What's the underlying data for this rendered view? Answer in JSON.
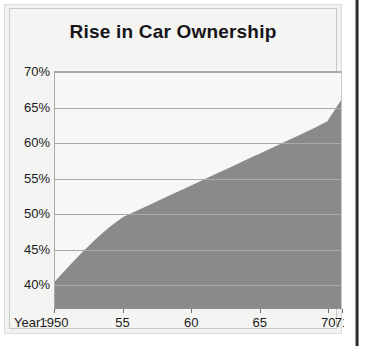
{
  "figure": {
    "title": "Rise in Car Ownership",
    "x_axis_title": "Year :"
  },
  "chart_data": {
    "type": "area",
    "title": "Rise in Car Ownership",
    "xlabel": "Year",
    "ylabel": "",
    "xlim": [
      1950,
      1971
    ],
    "ylim": [
      36.5,
      70
    ],
    "grid": true,
    "legend": null,
    "fill_color": "#8a8a8a",
    "gridline_color": "#a9a9a6",
    "plot_background": "#f7f7f5",
    "y_tick_labels": [
      "70%",
      "65%",
      "60%",
      "55%",
      "50%",
      "45%",
      "40%"
    ],
    "y_tick_values": [
      70,
      65,
      60,
      55,
      50,
      45,
      40
    ],
    "x_tick_labels": [
      "1950",
      "55",
      "60",
      "65",
      "70",
      "71"
    ],
    "x_tick_values": [
      1950,
      1955,
      1960,
      1965,
      1970,
      1971
    ],
    "x": [
      1950,
      1951,
      1952,
      1953,
      1954,
      1955,
      1956,
      1957,
      1958,
      1959,
      1960,
      1961,
      1962,
      1963,
      1964,
      1965,
      1966,
      1967,
      1968,
      1969,
      1970,
      1971
    ],
    "values": [
      40.3,
      42.4,
      44.4,
      46.3,
      48.0,
      49.4,
      50.3,
      51.2,
      52.1,
      53.0,
      53.9,
      54.8,
      55.7,
      56.6,
      57.5,
      58.4,
      59.3,
      60.2,
      61.1,
      62.0,
      63.0,
      66.0
    ]
  }
}
